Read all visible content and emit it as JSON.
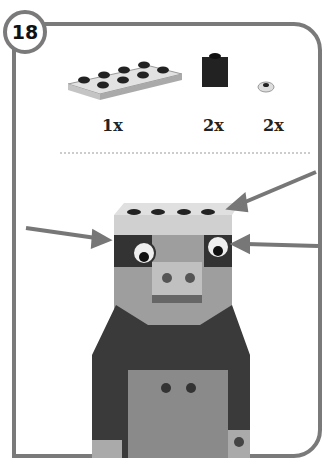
{
  "step": {
    "number": "18"
  },
  "parts": [
    {
      "name": "plate-2x4-white",
      "quantity": "1x"
    },
    {
      "name": "brick-1x1-black",
      "quantity": "2x"
    },
    {
      "name": "round-tile-eye",
      "quantity": "2x"
    }
  ],
  "colors": {
    "frame": "#7a7a7a",
    "dark": "#2b2b2b",
    "mid": "#8a8a8a",
    "light": "#b8b8b8",
    "plate": "#d4d4d4"
  }
}
